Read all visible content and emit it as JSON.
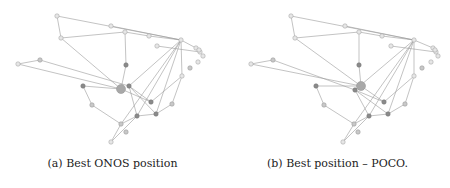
{
  "figures": [
    {
      "id": "a",
      "caption": "(a) Best ONOS position",
      "controller_node": "n19",
      "nodes": {
        "n1": [
          57,
          16,
          "light"
        ],
        "n2": [
          111,
          26,
          "light"
        ],
        "n3": [
          125,
          32,
          "light"
        ],
        "n4": [
          149,
          36,
          "light"
        ],
        "n5": [
          181,
          40,
          "light"
        ],
        "n6": [
          61,
          38,
          "light"
        ],
        "n7": [
          157,
          46,
          "light"
        ],
        "n8": [
          196,
          48,
          "light"
        ],
        "n9": [
          200,
          52,
          "light"
        ],
        "n10": [
          203,
          56,
          "light"
        ],
        "n11": [
          199,
          50,
          "light"
        ],
        "n12": [
          198,
          62,
          "light"
        ],
        "n13": [
          190,
          68,
          "mid"
        ],
        "n14": [
          40,
          60,
          "mid"
        ],
        "n15": [
          18,
          64,
          "light"
        ],
        "n16": [
          126,
          65,
          "dark"
        ],
        "n17": [
          182,
          76,
          "light"
        ],
        "n18": [
          83,
          86,
          "dark"
        ],
        "n19": [
          121,
          89,
          "big"
        ],
        "n20": [
          129,
          86,
          "dark"
        ],
        "n21": [
          151,
          102,
          "dark"
        ],
        "n22": [
          172,
          104,
          "mid"
        ],
        "n23": [
          92,
          105,
          "mid"
        ],
        "n24": [
          137,
          116,
          "dark"
        ],
        "n25": [
          156,
          114,
          "dark"
        ],
        "n26": [
          121,
          124,
          "mid"
        ],
        "n27": [
          126,
          132,
          "mid"
        ],
        "n28": [
          111,
          142,
          "light"
        ]
      }
    },
    {
      "id": "b",
      "caption": "(b) Best position – POCO.",
      "controller_node": "n19",
      "nodes": {
        "n1": [
          66,
          16,
          "light"
        ],
        "n2": [
          120,
          26,
          "light"
        ],
        "n3": [
          134,
          32,
          "light"
        ],
        "n4": [
          157,
          36,
          "light"
        ],
        "n5": [
          189,
          40,
          "light"
        ],
        "n6": [
          70,
          38,
          "light"
        ],
        "n7": [
          166,
          46,
          "light"
        ],
        "n8": [
          208,
          48,
          "light"
        ],
        "n9": [
          211,
          52,
          "light"
        ],
        "n10": [
          213,
          56,
          "light"
        ],
        "n11": [
          210,
          50,
          "light"
        ],
        "n12": [
          206,
          62,
          "light"
        ],
        "n13": [
          197,
          68,
          "mid"
        ],
        "n14": [
          48,
          60,
          "mid"
        ],
        "n15": [
          26,
          64,
          "light"
        ],
        "n16": [
          134,
          65,
          "dark"
        ],
        "n17": [
          189,
          76,
          "light"
        ],
        "n18": [
          91,
          86,
          "dark"
        ],
        "n19": [
          136,
          86,
          "big"
        ],
        "n20": [
          130,
          90,
          "dark"
        ],
        "n21": [
          159,
          102,
          "dark"
        ],
        "n22": [
          180,
          104,
          "mid"
        ],
        "n23": [
          99,
          105,
          "mid"
        ],
        "n24": [
          144,
          116,
          "dark"
        ],
        "n25": [
          163,
          114,
          "dark"
        ],
        "n26": [
          129,
          124,
          "mid"
        ],
        "n27": [
          133,
          132,
          "mid"
        ],
        "n28": [
          118,
          142,
          "light"
        ]
      }
    }
  ],
  "edges": [
    [
      "n1",
      "n5"
    ],
    [
      "n1",
      "n6"
    ],
    [
      "n6",
      "n3"
    ],
    [
      "n3",
      "n4"
    ],
    [
      "n4",
      "n5"
    ],
    [
      "n3",
      "n16"
    ],
    [
      "n16",
      "n19"
    ],
    [
      "n6",
      "n19"
    ],
    [
      "n5",
      "n8"
    ],
    [
      "n7",
      "n9"
    ],
    [
      "n5",
      "n17"
    ],
    [
      "n17",
      "n22"
    ],
    [
      "n5",
      "n20"
    ],
    [
      "n5",
      "n24"
    ],
    [
      "n5",
      "n25"
    ],
    [
      "n5",
      "n26"
    ],
    [
      "n14",
      "n15"
    ],
    [
      "n15",
      "n19"
    ],
    [
      "n14",
      "n20"
    ],
    [
      "n18",
      "n19"
    ],
    [
      "n18",
      "n23"
    ],
    [
      "n23",
      "n26"
    ],
    [
      "n26",
      "n24"
    ],
    [
      "n24",
      "n25"
    ],
    [
      "n25",
      "n22"
    ],
    [
      "n19",
      "n21"
    ],
    [
      "n20",
      "n21"
    ],
    [
      "n20",
      "n25"
    ],
    [
      "n20",
      "n24"
    ],
    [
      "n17",
      "n21"
    ],
    [
      "n26",
      "n28"
    ],
    [
      "n24",
      "n28"
    ],
    [
      "n2",
      "n5"
    ]
  ]
}
